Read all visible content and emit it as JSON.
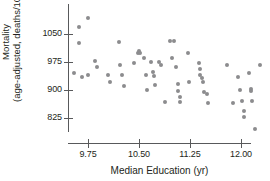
{
  "chart_data": {
    "type": "scatter",
    "title": "",
    "xlabel": "Median Education (yr)",
    "ylabel_line1": "Mortality",
    "ylabel_line2": "(age-adjusted, deaths/100,000)",
    "xticks": [
      9.75,
      10.5,
      11.25,
      12.0
    ],
    "xtick_labels": [
      "9.75",
      "10.50",
      "11.25",
      "12.00"
    ],
    "yticks": [
      825,
      900,
      975,
      1050
    ],
    "ytick_labels": [
      "825",
      "900",
      "975",
      "1050"
    ],
    "xlim": [
      9.45,
      12.4
    ],
    "ylim": [
      770,
      1110
    ],
    "grid": false,
    "legend": "none",
    "point_color": "#8c8c8e",
    "axis_color": "#58595b",
    "background_color": "#ffffff",
    "points": [
      {
        "x": 9.75,
        "y": 1092
      },
      {
        "x": 9.62,
        "y": 1069
      },
      {
        "x": 9.62,
        "y": 1026
      },
      {
        "x": 9.55,
        "y": 946
      },
      {
        "x": 9.66,
        "y": 936
      },
      {
        "x": 9.75,
        "y": 940
      },
      {
        "x": 9.85,
        "y": 978
      },
      {
        "x": 9.88,
        "y": 962
      },
      {
        "x": 10.05,
        "y": 940
      },
      {
        "x": 10.07,
        "y": 922
      },
      {
        "x": 10.2,
        "y": 1029
      },
      {
        "x": 10.22,
        "y": 968
      },
      {
        "x": 10.25,
        "y": 941
      },
      {
        "x": 10.28,
        "y": 911
      },
      {
        "x": 10.42,
        "y": 973
      },
      {
        "x": 10.48,
        "y": 998
      },
      {
        "x": 10.5,
        "y": 1004
      },
      {
        "x": 10.52,
        "y": 1000
      },
      {
        "x": 10.58,
        "y": 986
      },
      {
        "x": 10.6,
        "y": 941
      },
      {
        "x": 10.62,
        "y": 899
      },
      {
        "x": 10.68,
        "y": 974
      },
      {
        "x": 10.7,
        "y": 948
      },
      {
        "x": 10.72,
        "y": 937
      },
      {
        "x": 10.74,
        "y": 913
      },
      {
        "x": 10.8,
        "y": 975
      },
      {
        "x": 10.82,
        "y": 966
      },
      {
        "x": 10.88,
        "y": 868
      },
      {
        "x": 10.95,
        "y": 1030
      },
      {
        "x": 11.02,
        "y": 1030
      },
      {
        "x": 10.98,
        "y": 986
      },
      {
        "x": 11.05,
        "y": 962
      },
      {
        "x": 11.08,
        "y": 916
      },
      {
        "x": 11.08,
        "y": 898
      },
      {
        "x": 11.1,
        "y": 882
      },
      {
        "x": 11.1,
        "y": 869
      },
      {
        "x": 11.22,
        "y": 1000
      },
      {
        "x": 11.24,
        "y": 921
      },
      {
        "x": 11.38,
        "y": 973
      },
      {
        "x": 11.4,
        "y": 957
      },
      {
        "x": 11.4,
        "y": 941
      },
      {
        "x": 11.42,
        "y": 931
      },
      {
        "x": 11.44,
        "y": 921
      },
      {
        "x": 11.46,
        "y": 895
      },
      {
        "x": 11.5,
        "y": 888
      },
      {
        "x": 11.52,
        "y": 866
      },
      {
        "x": 11.8,
        "y": 966
      },
      {
        "x": 11.88,
        "y": 864
      },
      {
        "x": 11.96,
        "y": 936
      },
      {
        "x": 11.98,
        "y": 900
      },
      {
        "x": 12.02,
        "y": 871
      },
      {
        "x": 12.04,
        "y": 843
      },
      {
        "x": 12.04,
        "y": 829
      },
      {
        "x": 12.12,
        "y": 945
      },
      {
        "x": 12.14,
        "y": 903
      },
      {
        "x": 12.14,
        "y": 896
      },
      {
        "x": 12.16,
        "y": 871
      },
      {
        "x": 12.2,
        "y": 795
      },
      {
        "x": 12.28,
        "y": 966
      }
    ]
  }
}
